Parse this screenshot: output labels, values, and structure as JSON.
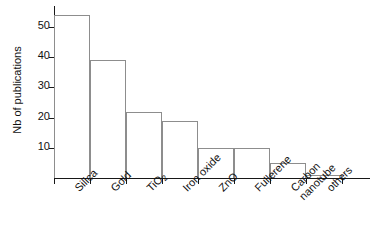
{
  "chart_data": {
    "type": "bar",
    "title": "",
    "xlabel": "",
    "ylabel": "Nb of publications",
    "categories": [
      "Silica",
      "Gold",
      "TiO2",
      "Iron oxide",
      "ZnO",
      "Fullerene",
      "Carbon nanotube",
      "others"
    ],
    "category_labels": [
      {
        "line1": "Silica",
        "line2": ""
      },
      {
        "line1": "Gold",
        "line2": ""
      },
      {
        "line1": "TiO",
        "sub": "2",
        "line2": ""
      },
      {
        "line1": "Iron oxide",
        "line2": ""
      },
      {
        "line1": "ZnO",
        "line2": ""
      },
      {
        "line1": "Fullerene",
        "line2": ""
      },
      {
        "line1": "Carbon",
        "line2": "nanotube"
      },
      {
        "line1": "others",
        "line2": ""
      }
    ],
    "values": [
      54,
      39,
      22,
      19,
      10,
      10,
      5,
      1
    ],
    "ylim": [
      0,
      57
    ],
    "yticks": [
      10,
      20,
      30,
      40,
      50
    ],
    "ytick_labels": [
      "10",
      "20",
      "30",
      "40",
      "50"
    ],
    "grid": false,
    "legend": false,
    "legend_position": "none",
    "bar_fill_color": "#ffffff",
    "bar_edge_color": "#8d8d8d",
    "axis_color": "#171717",
    "background_color": "#ffffff"
  }
}
